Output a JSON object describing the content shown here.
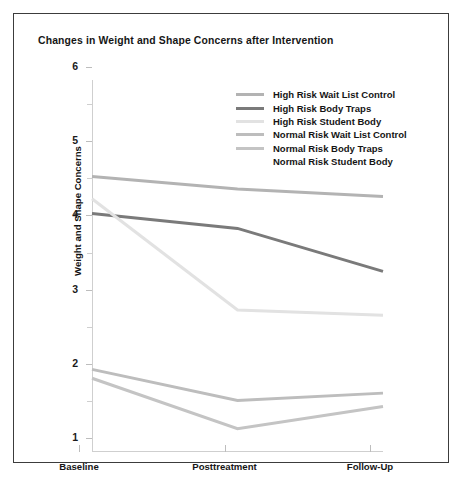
{
  "figure": {
    "title": "Changes in Weight and Shape Concerns after Intervention"
  },
  "chart_data": {
    "type": "line",
    "title": "Changes in Weight and Shape Concerns after Intervention",
    "xlabel": "",
    "ylabel": "Weight and Shape Concerns",
    "categories": [
      "Baseline",
      "Posttreatment",
      "Follow-Up"
    ],
    "ylim": [
      1,
      6
    ],
    "yticks": [
      1,
      2,
      3,
      4,
      5,
      6
    ],
    "ytick_labels": [
      "1",
      "2",
      "3",
      "4",
      "5",
      "6"
    ],
    "minor_yticks": [
      1.5,
      2.5,
      3.5,
      4.5,
      5.5
    ],
    "grid": false,
    "legend_position": "upper-right-inside",
    "series": [
      {
        "name": "High Risk Wait List Control",
        "values": [
          4.7,
          4.53,
          4.43
        ],
        "color": "#b3b3b3"
      },
      {
        "name": "High Risk Body Traps",
        "values": [
          4.2,
          4.0,
          3.42
        ],
        "color": "#7a7a7a"
      },
      {
        "name": "High Risk Student Body",
        "values": [
          4.4,
          2.9,
          2.83
        ],
        "color": "#e2e2e2"
      },
      {
        "name": "Normal Risk Wait List Control",
        "values": [
          2.1,
          1.68,
          1.78
        ],
        "color": "#bdbdbd"
      },
      {
        "name": "Normal Risk Body Traps",
        "values": [
          1.98,
          1.3,
          1.6
        ],
        "color": "#c4c4c4"
      },
      {
        "name": "Normal Risk Student Body",
        "values": [
          null,
          null,
          null
        ],
        "color": "#ffffff"
      }
    ]
  }
}
